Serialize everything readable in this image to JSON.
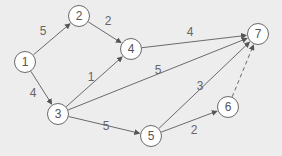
{
  "diagram": {
    "type": "directed-weighted-graph",
    "colors": {
      "background": "#ededed",
      "node_fill": "#ffffff",
      "stroke": "#6a6a6a",
      "text": "#555555"
    },
    "nodes": [
      {
        "id": "1",
        "label": "1",
        "x": 25,
        "y": 62
      },
      {
        "id": "2",
        "label": "2",
        "x": 79,
        "y": 16
      },
      {
        "id": "3",
        "label": "3",
        "x": 58,
        "y": 114
      },
      {
        "id": "4",
        "label": "4",
        "x": 131,
        "y": 49
      },
      {
        "id": "5",
        "label": "5",
        "x": 151,
        "y": 136
      },
      {
        "id": "6",
        "label": "6",
        "x": 228,
        "y": 107
      },
      {
        "id": "7",
        "label": "7",
        "x": 258,
        "y": 34
      }
    ],
    "edges": [
      {
        "from": "1",
        "to": "2",
        "weight": "5",
        "lx": 43,
        "ly": 31,
        "dashed": false
      },
      {
        "from": "1",
        "to": "3",
        "weight": "4",
        "lx": 33,
        "ly": 93,
        "dashed": false
      },
      {
        "from": "2",
        "to": "4",
        "weight": "2",
        "lx": 108,
        "ly": 21,
        "dashed": false
      },
      {
        "from": "3",
        "to": "4",
        "weight": "1",
        "lx": 91,
        "ly": 77,
        "dashed": false
      },
      {
        "from": "4",
        "to": "7",
        "weight": "4",
        "lx": 190,
        "ly": 32,
        "dashed": false
      },
      {
        "from": "3",
        "to": "7",
        "weight": "5",
        "lx": 158,
        "ly": 70,
        "dashed": false
      },
      {
        "from": "3",
        "to": "5",
        "weight": "5",
        "lx": 106,
        "ly": 126,
        "dashed": false
      },
      {
        "from": "5",
        "to": "7",
        "weight": "3",
        "lx": 200,
        "ly": 86,
        "dashed": false
      },
      {
        "from": "5",
        "to": "6",
        "weight": "2",
        "lx": 194,
        "ly": 130,
        "dashed": false
      },
      {
        "from": "6",
        "to": "7",
        "weight": "",
        "lx": 0,
        "ly": 0,
        "dashed": true
      }
    ]
  }
}
